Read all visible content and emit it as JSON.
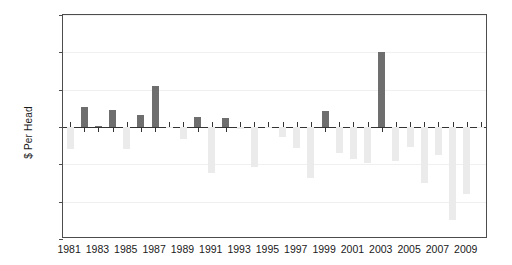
{
  "chart_data": {
    "type": "bar",
    "title": "",
    "xlabel": "",
    "ylabel": "$ Per Head",
    "ylim": [
      -150,
      150
    ],
    "yticks": [
      150,
      100,
      50,
      0,
      -50,
      -100,
      -150
    ],
    "ytick_labels": [
      "150",
      "100",
      "50",
      "0",
      "−50",
      "−100",
      "−150"
    ],
    "grid": true,
    "legend": "none",
    "xtick_labels": [
      "1981",
      "1983",
      "1985",
      "1987",
      "1989",
      "1991",
      "1993",
      "1995",
      "1997",
      "1999",
      "2001",
      "2003",
      "2005",
      "2007",
      "2009"
    ],
    "categories": [
      "1981",
      "1982",
      "1983",
      "1984",
      "1985",
      "1986",
      "1987",
      "1988",
      "1989",
      "1990",
      "1991",
      "1992",
      "1993",
      "1994",
      "1995",
      "1996",
      "1997",
      "1998",
      "1999",
      "2000",
      "2001",
      "2002",
      "2003",
      "2004",
      "2005",
      "2006",
      "2007",
      "2008",
      "2009",
      "2010"
    ],
    "values": [
      -30,
      27,
      1,
      23,
      -29,
      16,
      55,
      -2,
      -16,
      13,
      -62,
      12,
      -3,
      -54,
      -2,
      -13,
      -28,
      -68,
      21,
      -35,
      -43,
      -48,
      101,
      -45,
      -27,
      -75,
      -38,
      -124,
      -90,
      -1
    ],
    "colors": {
      "positive": "#6e6e6e",
      "negative": "#ebebeb",
      "axis": "#333333",
      "grid": "#f0f0f0",
      "frame": "#4d4d4d",
      "text": "#1a1a1a",
      "background": "#ffffff"
    }
  }
}
